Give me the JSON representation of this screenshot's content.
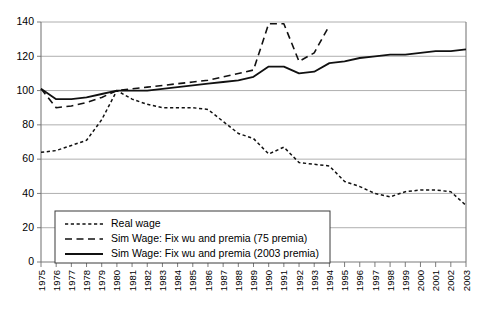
{
  "chart_data": {
    "type": "line",
    "title": "",
    "xlabel": "",
    "ylabel": "",
    "ylim": [
      0,
      140
    ],
    "ytick_step": 20,
    "yticks": [
      "0",
      "20",
      "40",
      "60",
      "80",
      "100",
      "120",
      "140"
    ],
    "grid": true,
    "legend_position": "bottom-left",
    "x": [
      "1975",
      "1976",
      "1977",
      "1978",
      "1979",
      "1980",
      "1981",
      "1982",
      "1983",
      "1984",
      "1985",
      "1986",
      "1987",
      "1988",
      "1989",
      "1990",
      "1991",
      "1992",
      "1993",
      "1994",
      "1995",
      "1996",
      "1997",
      "1998",
      "1999",
      "2000",
      "2001",
      "2002",
      "2003"
    ],
    "series": [
      {
        "name": "Real wage",
        "style": "dotted",
        "values": [
          64,
          65,
          68,
          71,
          83,
          100,
          95,
          92,
          90,
          90,
          90,
          89,
          82,
          75,
          72,
          63,
          67,
          58,
          57,
          56,
          47,
          44,
          40,
          38,
          41,
          42,
          42,
          41,
          33
        ]
      },
      {
        "name": "Sim Wage: Fix wu and premia (75 premia)",
        "style": "dashed",
        "values": [
          101,
          90,
          91,
          93,
          96,
          100,
          101,
          102,
          103,
          104,
          105,
          106,
          108,
          110,
          112,
          139,
          139,
          117,
          122,
          138,
          null,
          null,
          null,
          null,
          null,
          null,
          null,
          null,
          null
        ]
      },
      {
        "name": "Sim Wage: Fix wu and premia (2003 premia)",
        "style": "solid",
        "values": [
          101,
          95,
          95,
          96,
          98,
          100,
          100,
          100,
          101,
          102,
          103,
          104,
          105,
          106,
          108,
          114,
          114,
          110,
          111,
          116,
          117,
          119,
          120,
          121,
          121,
          122,
          123,
          123,
          124
        ]
      }
    ]
  },
  "legend": {
    "items": [
      {
        "label": "Real wage",
        "style": "dotted"
      },
      {
        "label": "Sim Wage: Fix wu and premia (75 premia)",
        "style": "dashed"
      },
      {
        "label": "Sim Wage: Fix wu and premia (2003 premia)",
        "style": "solid"
      }
    ]
  }
}
